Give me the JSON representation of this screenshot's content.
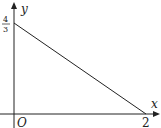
{
  "diagram": {
    "type": "coordinate-plot",
    "axes": {
      "x_label": "x",
      "y_label": "y",
      "origin_label": "O"
    },
    "line": {
      "y_intercept_label_num": "4",
      "y_intercept_label_den": "3",
      "x_intercept_label": "2",
      "y_intercept": 1.3333,
      "x_intercept": 2
    }
  }
}
